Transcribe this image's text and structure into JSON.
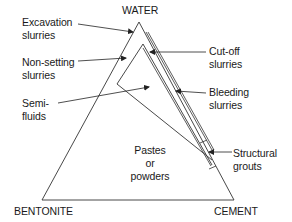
{
  "diagram": {
    "vertices": {
      "top": "WATER",
      "bottom_left": "BENTONITE",
      "bottom_right": "CEMENT"
    },
    "labels": {
      "excavation": "Excavation\nslurries",
      "non_setting": "Non-setting\nslurries",
      "semi_fluids": "Semi-\nfluids",
      "cut_off": "Cut-off\nslurries",
      "bleeding": "Bleeding\nslurries",
      "structural": "Structural\ngrouts",
      "pastes": "Pastes\nor\npowders"
    },
    "line_color": "#333333",
    "text_color": "#1a1a1a"
  }
}
